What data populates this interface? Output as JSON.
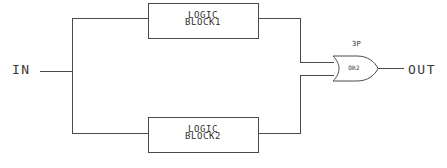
{
  "diagram": {
    "type": "digital-logic-schematic",
    "line_color": "#4a4a4a",
    "background_color": "#ffffff"
  },
  "ports": {
    "input": {
      "label": "IN"
    },
    "output": {
      "label": "OUT"
    }
  },
  "blocks": [
    {
      "id": "block1",
      "line1": "LOGIC",
      "line2": "BLOCK1"
    },
    {
      "id": "block2",
      "line1": "LOGIC",
      "line2": "BLOCK2"
    }
  ],
  "gate": {
    "id": "or-gate",
    "inner_label": "OR2",
    "top_label": "3P",
    "inputs": 2
  }
}
